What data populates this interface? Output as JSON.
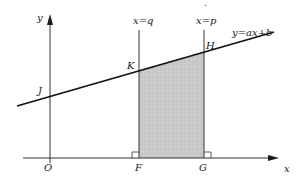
{
  "diagram": {
    "title": "",
    "axes": {
      "x_label": "x",
      "y_label": "y",
      "origin_label": "O"
    },
    "line": {
      "equation_label": "y=ax+b"
    },
    "verticals": [
      {
        "label": "x=q",
        "top_point": "K",
        "foot_point": "F"
      },
      {
        "label": "x=p",
        "top_point": "H",
        "foot_point": "G"
      }
    ],
    "points": {
      "J": "J",
      "K": "K",
      "H": "H",
      "F": "F",
      "G": "G",
      "O": "O"
    },
    "shaded_region": {
      "description": "trapezoid FGHK under the line between x=q and x=p",
      "fill_color": "#c8c8c8"
    },
    "colors": {
      "stroke": "#1a1a1a",
      "axis": "#333333",
      "shade": "#c8c8c8"
    }
  }
}
